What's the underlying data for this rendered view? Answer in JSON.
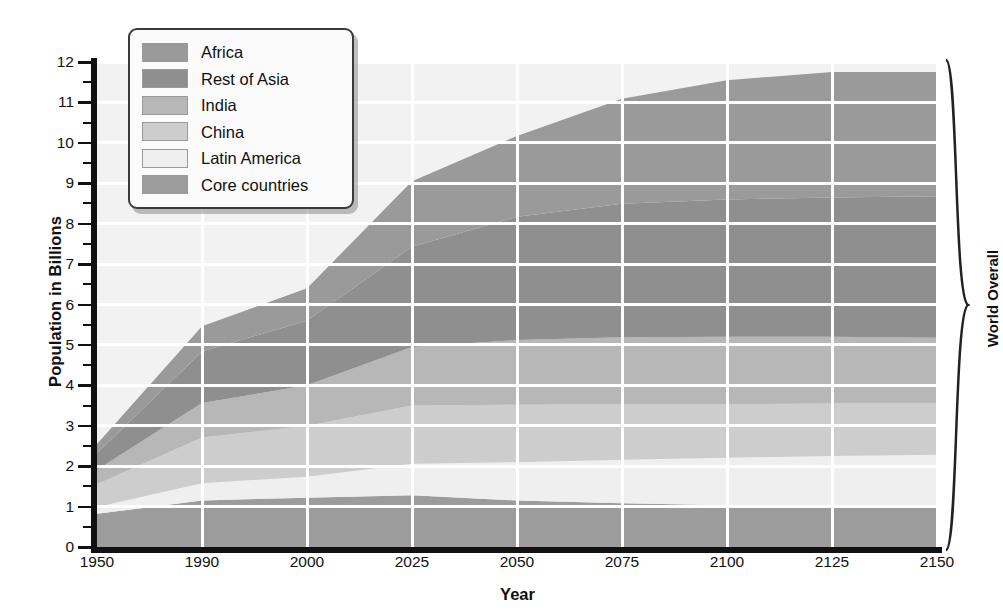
{
  "chart_data": {
    "type": "area",
    "stacked": true,
    "title": "",
    "xlabel": "Year",
    "ylabel": "Population in Billions",
    "right_label": "World Overall",
    "categories": [
      "1950",
      "1990",
      "2000",
      "2025",
      "2050",
      "2075",
      "2100",
      "2125",
      "2150"
    ],
    "x_is_categorical": true,
    "ylim": [
      0,
      12
    ],
    "y_ticks": [
      0,
      1,
      2,
      3,
      4,
      5,
      6,
      7,
      8,
      9,
      10,
      11,
      12
    ],
    "y_minor_ticks": [
      0.5,
      1.5,
      2.5,
      3.5,
      4.5,
      5.5,
      6.5,
      7.5,
      8.5,
      9.5,
      10.5,
      11.5
    ],
    "grid": "white gridlines, horizontal at every integer, vertical at every category",
    "legend_position": "top-left inside plot",
    "stack_order_bottom_to_top": [
      "Core countries",
      "Latin America",
      "China",
      "India",
      "Rest of Asia",
      "Africa"
    ],
    "series": [
      {
        "name": "Core countries",
        "color": "#9c9c9c",
        "values": [
          0.82,
          1.15,
          1.22,
          1.28,
          1.15,
          1.08,
          1.03,
          1.0,
          0.98
        ]
      },
      {
        "name": "Latin America",
        "color": "#efefef",
        "values": [
          0.17,
          0.43,
          0.52,
          0.78,
          0.95,
          1.08,
          1.18,
          1.25,
          1.3
        ]
      },
      {
        "name": "China",
        "color": "#cdcdcd",
        "values": [
          0.56,
          1.13,
          1.26,
          1.44,
          1.42,
          1.38,
          1.32,
          1.3,
          1.27
        ]
      },
      {
        "name": "India",
        "color": "#b7b7b7",
        "values": [
          0.36,
          0.85,
          1.0,
          1.45,
          1.6,
          1.65,
          1.67,
          1.65,
          1.63
        ]
      },
      {
        "name": "Rest of Asia",
        "color": "#8f8f8f",
        "values": [
          0.41,
          1.28,
          1.6,
          2.48,
          3.05,
          3.3,
          3.4,
          3.45,
          3.5
        ]
      },
      {
        "name": "Africa",
        "color": "#9a9a9a",
        "values": [
          0.23,
          0.62,
          0.8,
          1.62,
          2.0,
          2.6,
          2.95,
          3.1,
          3.07
        ]
      }
    ],
    "cumulative_tops": {
      "Core countries": [
        0.82,
        1.15,
        1.22,
        1.28,
        1.15,
        1.08,
        1.03,
        1.0,
        0.98
      ],
      "Latin America": [
        0.99,
        1.58,
        1.74,
        2.06,
        2.1,
        2.16,
        2.21,
        2.25,
        2.28
      ],
      "China": [
        1.55,
        2.71,
        3.0,
        3.5,
        3.52,
        3.54,
        3.53,
        3.55,
        3.55
      ],
      "India": [
        1.91,
        3.56,
        4.0,
        4.95,
        5.12,
        5.19,
        5.2,
        5.2,
        5.18
      ],
      "Rest of Asia": [
        2.32,
        4.84,
        5.6,
        7.43,
        8.17,
        8.49,
        8.6,
        8.65,
        8.68
      ],
      "Africa": [
        2.55,
        5.46,
        6.4,
        9.05,
        10.17,
        11.09,
        11.55,
        11.75,
        11.75
      ]
    },
    "world_total": [
      2.55,
      5.46,
      6.4,
      9.05,
      10.17,
      11.09,
      11.55,
      11.75,
      11.75
    ]
  },
  "legend": {
    "items": [
      {
        "label": "Africa",
        "color": "#9a9a9a"
      },
      {
        "label": "Rest of Asia",
        "color": "#8f8f8f"
      },
      {
        "label": "India",
        "color": "#b7b7b7"
      },
      {
        "label": "China",
        "color": "#cdcdcd"
      },
      {
        "label": "Latin America",
        "color": "#efefef"
      },
      {
        "label": "Core countries",
        "color": "#9c9c9c"
      }
    ]
  },
  "axes": {
    "y_title": "Population in Billions",
    "x_title": "Year",
    "right_bracket_title": "World Overall"
  },
  "style": {
    "plot_background": "#f2f2f2",
    "gridline_color": "#ffffff",
    "axis_color": "#111111"
  }
}
